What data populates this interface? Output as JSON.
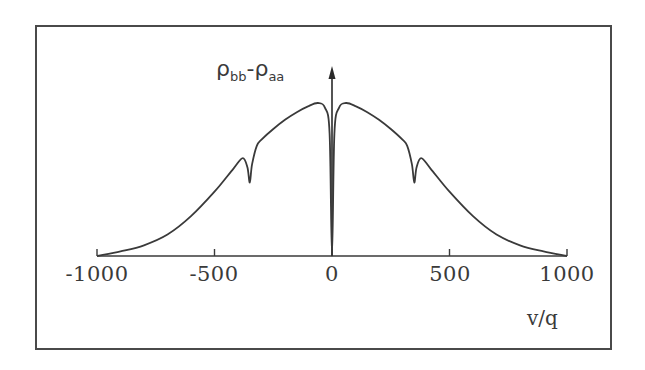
{
  "chart_data": {
    "type": "line",
    "title": "",
    "xlabel": "v/q",
    "ylabel": "ρbb-ρaa",
    "ylabel_parts": {
      "rho1": "ρ",
      "sub1": "bb",
      "dash": "-",
      "rho2": "ρ",
      "sub2": "aa"
    },
    "xlim": [
      -1000,
      1000
    ],
    "xticks": [
      -1000,
      -500,
      0,
      500,
      1000
    ],
    "xtick_labels": [
      "-1000",
      "-500",
      "0",
      "500",
      "1000"
    ],
    "yticks": [],
    "grid": false,
    "legend": null,
    "series": [
      {
        "name": "ρbb-ρaa",
        "x": [
          -1000,
          -900,
          -800,
          -700,
          -600,
          -500,
          -420,
          -380,
          -360,
          -350,
          -340,
          -320,
          -300,
          -250,
          -200,
          -150,
          -100,
          -60,
          -30,
          -10,
          0,
          10,
          30,
          60,
          100,
          150,
          200,
          250,
          300,
          320,
          340,
          350,
          360,
          380,
          420,
          500,
          600,
          700,
          800,
          900,
          1000
        ],
        "y": [
          0.0,
          0.03,
          0.07,
          0.14,
          0.26,
          0.42,
          0.57,
          0.64,
          0.58,
          0.48,
          0.6,
          0.72,
          0.76,
          0.83,
          0.89,
          0.94,
          0.98,
          1.0,
          0.97,
          0.8,
          0.0,
          0.8,
          0.97,
          1.0,
          0.98,
          0.94,
          0.89,
          0.83,
          0.76,
          0.72,
          0.6,
          0.48,
          0.58,
          0.64,
          0.57,
          0.42,
          0.26,
          0.14,
          0.07,
          0.03,
          0.0
        ]
      }
    ],
    "annotations": [
      "dips near v/q ≈ ±350",
      "sharp dip at v/q = 0"
    ]
  }
}
